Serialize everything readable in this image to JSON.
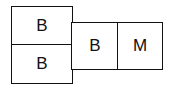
{
  "diagram": {
    "cells": [
      {
        "id": "top-left",
        "label": "B"
      },
      {
        "id": "bottom-left",
        "label": "B"
      },
      {
        "id": "middle",
        "label": "B"
      },
      {
        "id": "right",
        "label": "M"
      }
    ]
  }
}
